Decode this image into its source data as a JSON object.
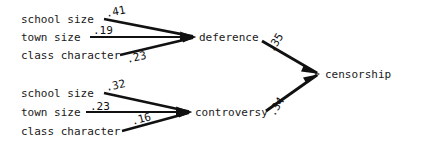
{
  "diagram": {
    "type": "path-analysis-diagram",
    "nodes": {
      "exogenous_top": [
        {
          "id": "school-size-top",
          "label": "school size"
        },
        {
          "id": "town-size-top",
          "label": "town size"
        },
        {
          "id": "class-character-top",
          "label": "class character"
        }
      ],
      "exogenous_bottom": [
        {
          "id": "school-size-bottom",
          "label": "school size"
        },
        {
          "id": "town-size-bottom",
          "label": "town size"
        },
        {
          "id": "class-character-bottom",
          "label": "class character"
        }
      ],
      "mediators": [
        {
          "id": "deference",
          "label": "deference"
        },
        {
          "id": "controversy",
          "label": "controversy"
        }
      ],
      "outcome": {
        "id": "censorship",
        "label": "censorship"
      }
    },
    "paths": [
      {
        "from": "school size",
        "to": "deference",
        "coefficient": ".41"
      },
      {
        "from": "town size",
        "to": "deference",
        "coefficient": ".19"
      },
      {
        "from": "class character",
        "to": "deference",
        "coefficient": ".23"
      },
      {
        "from": "school size",
        "to": "controversy",
        "coefficient": ".32"
      },
      {
        "from": "town size",
        "to": "controversy",
        "coefficient": ".23"
      },
      {
        "from": "class character",
        "to": "controversy",
        "coefficient": ".16"
      },
      {
        "from": "deference",
        "to": "censorship",
        "coefficient": ".35"
      },
      {
        "from": "controversy",
        "to": "censorship",
        "coefficient": ".34"
      }
    ],
    "colors": {
      "background": "#ffffff",
      "line": "#111111",
      "text": "#1a1a1a"
    }
  }
}
